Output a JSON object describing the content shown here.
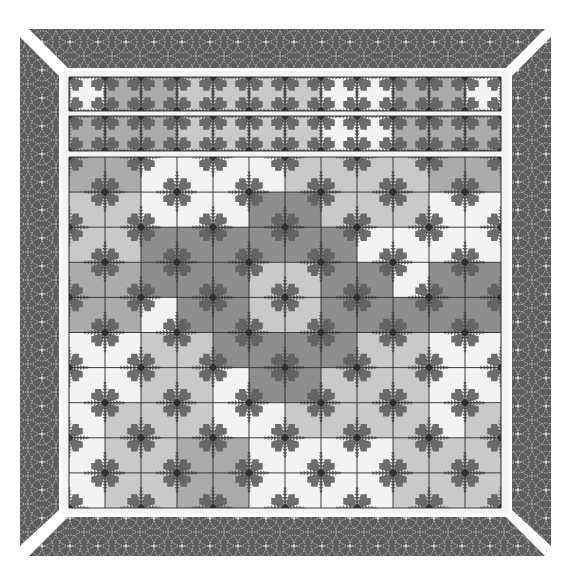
{
  "quilt": {
    "title": "",
    "colors": {
      "background": "#ffffff",
      "border": "#5c5c5c",
      "border_stitch": "#d8d8d8",
      "frame": "#f4f4f4",
      "grid_line": "#2b2b2b",
      "spike": "#5e5e5e",
      "spike_dark": "#4a4a4a",
      "tones": {
        "W": "#f3f3f3",
        "L": "#c9c9c9",
        "M": "#ababab",
        "D": "#8e8e8e"
      }
    },
    "layout": {
      "grid_left": 69,
      "cell_w": 36,
      "strips": [
        {
          "top": 77,
          "height": 34
        },
        {
          "top": 116,
          "height": 35
        }
      ],
      "main": {
        "top": 157,
        "rows": 10,
        "row_h": 35.1
      }
    },
    "strips": [
      [
        "W",
        "M",
        "M",
        "L",
        "L",
        "L",
        "L",
        "W",
        "W",
        "M",
        "M",
        "W"
      ],
      [
        "M",
        "M",
        "M",
        "L",
        "L",
        "L",
        "L",
        "W",
        "W",
        "M",
        "M",
        "M"
      ]
    ],
    "main_grid": [
      [
        "M",
        "M",
        "W",
        "W",
        "W",
        "W",
        "L",
        "L",
        "L",
        "L",
        "M",
        "M"
      ],
      [
        "L",
        "L",
        "W",
        "W",
        "W",
        "D",
        "D",
        "L",
        "L",
        "L",
        "W",
        "W"
      ],
      [
        "L",
        "L",
        "D",
        "D",
        "D",
        "D",
        "D",
        "D",
        "W",
        "W",
        "W",
        "W"
      ],
      [
        "M",
        "M",
        "D",
        "D",
        "D",
        "L",
        "L",
        "D",
        "D",
        "W",
        "D",
        "D"
      ],
      [
        "M",
        "M",
        "W",
        "D",
        "D",
        "L",
        "L",
        "D",
        "D",
        "D",
        "D",
        "D"
      ],
      [
        "W",
        "W",
        "L",
        "L",
        "D",
        "D",
        "D",
        "D",
        "L",
        "L",
        "W",
        "W"
      ],
      [
        "W",
        "W",
        "L",
        "L",
        "W",
        "D",
        "D",
        "L",
        "L",
        "L",
        "W",
        "W"
      ],
      [
        "W",
        "L",
        "L",
        "L",
        "W",
        "W",
        "L",
        "L",
        "L",
        "L",
        "W",
        "L"
      ],
      [
        "W",
        "L",
        "L",
        "M",
        "M",
        "W",
        "W",
        "W",
        "W",
        "L",
        "L",
        "L"
      ],
      [
        "W",
        "L",
        "L",
        "M",
        "M",
        "W",
        "W",
        "W",
        "W",
        "L",
        "L",
        "L"
      ]
    ]
  },
  "caption": {
    "text": ""
  }
}
